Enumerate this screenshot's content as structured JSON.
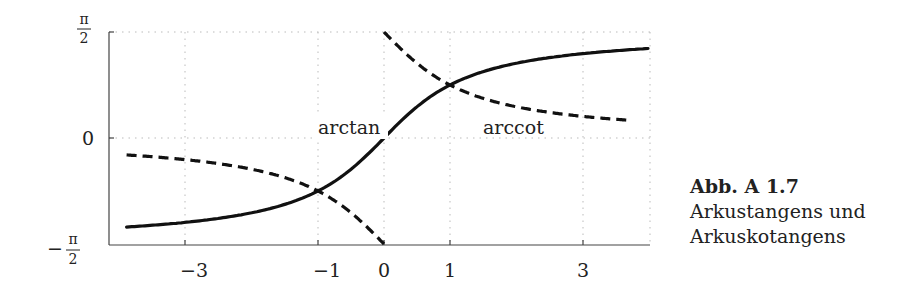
{
  "chart_data": {
    "type": "line",
    "title": "",
    "xlabel": "",
    "ylabel": "",
    "xlim": [
      -4.03,
      4.03
    ],
    "ylim": [
      -1.5708,
      1.5708
    ],
    "grid": "dotted",
    "xticks": [
      -3,
      -1,
      0,
      1,
      3
    ],
    "xtick_labels": [
      "−3",
      "−1",
      "0",
      "1",
      "3"
    ],
    "yticks": [
      -1.5708,
      0,
      1.5708
    ],
    "ytick_labels": [
      "−π/2",
      "0",
      "π/2"
    ],
    "series": [
      {
        "name": "arctan",
        "style": "solid",
        "x": [
          -4,
          -3,
          -2,
          -1.5,
          -1,
          -0.5,
          0,
          0.5,
          1,
          1.5,
          2,
          3,
          4
        ],
        "values": [
          -1.3258,
          -1.249,
          -1.1071,
          -0.9828,
          -0.7854,
          -0.4636,
          0,
          0.4636,
          0.7854,
          0.9828,
          1.1071,
          1.249,
          1.3258
        ]
      },
      {
        "name": "arccot",
        "style": "dashed",
        "note": "plotted branch with values in (-pi/2, pi/2): arccot(x) = arctan(1/x)",
        "x": [
          -4,
          -3,
          -2,
          -1.5,
          -1,
          -0.5,
          -0.01,
          0.01,
          0.5,
          1,
          1.5,
          2,
          3,
          4
        ],
        "values": [
          -0.245,
          -0.3218,
          -0.4636,
          -0.588,
          -0.7854,
          -1.1071,
          -1.5608,
          1.5608,
          1.1071,
          0.7854,
          0.588,
          0.4636,
          0.3218,
          0.245
        ]
      }
    ],
    "annotations": [
      {
        "text": "arctan",
        "x": -0.9,
        "y": 0.1
      },
      {
        "text": "arccot",
        "x": 1.5,
        "y": 0.1
      }
    ]
  },
  "labels": {
    "arctan": "arctan",
    "arccot": "arccot",
    "ytick_top_num": "π",
    "ytick_top_den": "2",
    "ytick_zero": "0",
    "ytick_bot_sign": "−",
    "ytick_bot_num": "π",
    "ytick_bot_den": "2",
    "xtick_m3": "−3",
    "xtick_m1": "−1",
    "xtick_0": "0",
    "xtick_1": "1",
    "xtick_3": "3"
  },
  "caption": {
    "title": "Abb. A 1.7",
    "line1": "Arkustangens und",
    "line2": "Arkuskotangens"
  }
}
